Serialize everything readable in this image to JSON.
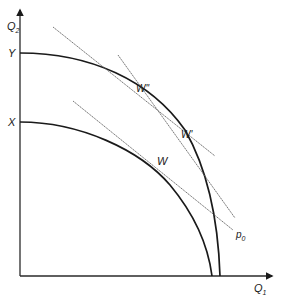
{
  "diagram": {
    "type": "production-possibility-frontiers",
    "axes": {
      "y_label": "Q",
      "y_sub": "2",
      "x_label": "Q",
      "x_sub": "1"
    },
    "intercept_labels": {
      "outer": "Y",
      "inner": "X"
    },
    "points": {
      "w": "W",
      "w_prime": "W'",
      "w_double_prime": "W''"
    },
    "price_line_label": "p",
    "price_line_sub": "0"
  }
}
